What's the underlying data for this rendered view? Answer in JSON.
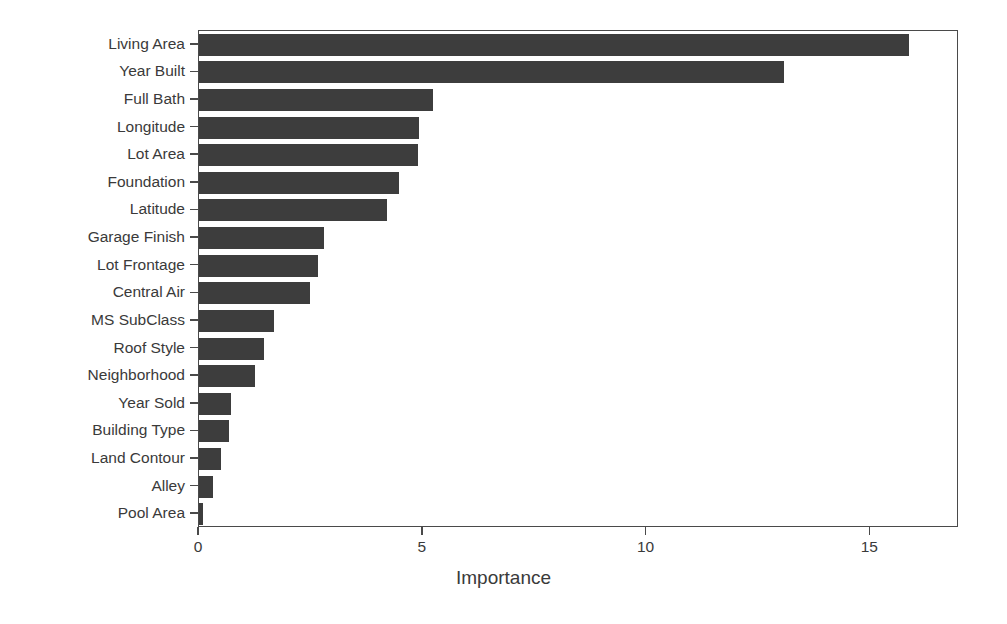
{
  "chart_data": {
    "type": "bar",
    "orientation": "horizontal",
    "title": "",
    "xlabel": "Importance",
    "ylabel": "",
    "xlim": [
      0,
      16.98
    ],
    "xticks": [
      0,
      5,
      10,
      15
    ],
    "xtick_labels": [
      "0",
      "5",
      "10",
      "15"
    ],
    "grid": false,
    "legend": null,
    "bar_color": "#3d3d3d",
    "axis_color": "#4a4a4a",
    "background_color": "#ffffff",
    "categories": [
      "Living Area",
      "Year Built",
      "Full Bath",
      "Longitude",
      "Lot Area",
      "Foundation",
      "Latitude",
      "Garage Finish",
      "Lot Frontage",
      "Central Air",
      "MS SubClass",
      "Roof Style",
      "Neighborhood",
      "Year Sold",
      "Building Type",
      "Land Contour",
      "Alley",
      "Pool Area"
    ],
    "values": [
      15.87,
      13.08,
      5.23,
      4.92,
      4.89,
      4.47,
      4.2,
      2.79,
      2.65,
      2.48,
      1.68,
      1.45,
      1.25,
      0.72,
      0.67,
      0.5,
      0.31,
      0.08
    ]
  }
}
